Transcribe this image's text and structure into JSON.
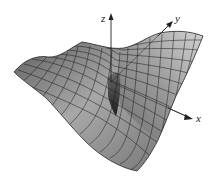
{
  "figure": {
    "type": "3d-surface-plot",
    "axes": {
      "x": {
        "label": "x"
      },
      "y": {
        "label": "y"
      },
      "z": {
        "label": "z"
      }
    },
    "colors": {
      "surface_light": "#c8c8c8",
      "surface_mid": "#8a8a8a",
      "surface_dark": "#3a3a3a",
      "mesh_lines": "#1a1a1a",
      "axis": "#222222",
      "background": "#ffffff"
    }
  }
}
